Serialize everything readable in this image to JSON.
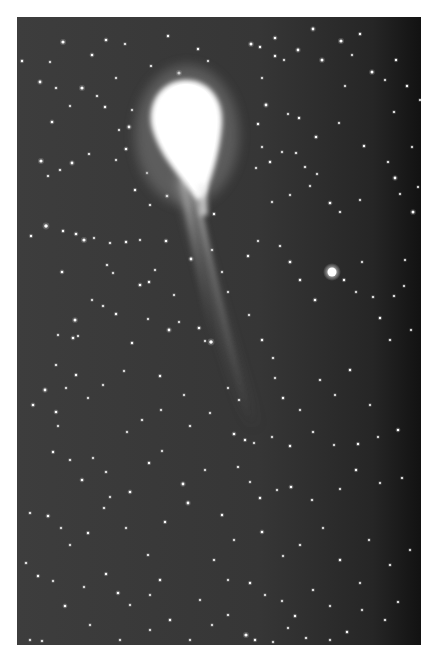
{
  "image": {
    "subject": "Comet with long ion tail against a star field",
    "frame": {
      "x": 17,
      "y": 17,
      "width": 404,
      "height": 628
    },
    "colors": {
      "margin": "#ffffff",
      "sky": "#3c3c3c",
      "sky_dark_edge": "#141414",
      "coma": "#ffffff",
      "tail": "#bdbdbd",
      "star": "#ffffff"
    }
  },
  "comet": {
    "head": {
      "cx": 186,
      "cy": 130,
      "rx": 36,
      "ry": 50
    },
    "nucleus_tip": {
      "x": 205,
      "y": 195
    },
    "tail_end": {
      "x": 258,
      "y": 425
    }
  },
  "bright_star": {
    "x": 332,
    "y": 272,
    "r": 4.5
  },
  "stars": [
    [
      63,
      42,
      1.6
    ],
    [
      106,
      40,
      1.3
    ],
    [
      125,
      44,
      1.1
    ],
    [
      168,
      36,
      1.2
    ],
    [
      198,
      49,
      1.2
    ],
    [
      251,
      44,
      1.5
    ],
    [
      275,
      38,
      1.3
    ],
    [
      298,
      50,
      1.4
    ],
    [
      322,
      60,
      1.5
    ],
    [
      360,
      34,
      1.2
    ],
    [
      372,
      72,
      1.5
    ],
    [
      396,
      60,
      1.2
    ],
    [
      50,
      62,
      1.0
    ],
    [
      92,
      55,
      1.3
    ],
    [
      151,
      66,
      1.1
    ],
    [
      179,
      73,
      1.6
    ],
    [
      208,
      61,
      1.0
    ],
    [
      260,
      47,
      1.2
    ],
    [
      275,
      56,
      1.2
    ],
    [
      284,
      60,
      1.0
    ],
    [
      313,
      29,
      1.4
    ],
    [
      341,
      41,
      1.6
    ],
    [
      352,
      55,
      1.0
    ],
    [
      22,
      61,
      1.2
    ],
    [
      40,
      82,
      1.4
    ],
    [
      82,
      88,
      1.6
    ],
    [
      105,
      107,
      1.2
    ],
    [
      116,
      78,
      1.0
    ],
    [
      132,
      110,
      1.0
    ],
    [
      52,
      122,
      1.3
    ],
    [
      56,
      88,
      1.1
    ],
    [
      70,
      106,
      1.0
    ],
    [
      97,
      96,
      1.1
    ],
    [
      119,
      130,
      1.0
    ],
    [
      129,
      127,
      1.4
    ],
    [
      262,
      78,
      1.0
    ],
    [
      266,
      105,
      1.4
    ],
    [
      258,
      124,
      1.2
    ],
    [
      288,
      114,
      1.0
    ],
    [
      299,
      118,
      1.2
    ],
    [
      345,
      86,
      1.0
    ],
    [
      385,
      80,
      1.0
    ],
    [
      407,
      86,
      1.2
    ],
    [
      420,
      100,
      1.0
    ],
    [
      394,
      112,
      1.1
    ],
    [
      316,
      137,
      1.3
    ],
    [
      282,
      152,
      1.0
    ],
    [
      41,
      161,
      1.6
    ],
    [
      72,
      163,
      1.4
    ],
    [
      89,
      154,
      1.1
    ],
    [
      48,
      176,
      1.1
    ],
    [
      116,
      160,
      1.0
    ],
    [
      126,
      149,
      1.3
    ],
    [
      147,
      173,
      1.0
    ],
    [
      60,
      170,
      1.1
    ],
    [
      135,
      190,
      1.2
    ],
    [
      167,
      196,
      1.3
    ],
    [
      150,
      205,
      1.1
    ],
    [
      214,
      214,
      1.2
    ],
    [
      256,
      168,
      1.0
    ],
    [
      262,
      147,
      1.0
    ],
    [
      296,
      153,
      1.1
    ],
    [
      339,
      123,
      1.0
    ],
    [
      364,
      146,
      1.2
    ],
    [
      388,
      162,
      1.1
    ],
    [
      395,
      178,
      1.4
    ],
    [
      412,
      147,
      1.0
    ],
    [
      418,
      187,
      1.0
    ],
    [
      413,
      212,
      1.5
    ],
    [
      270,
      162,
      1.2
    ],
    [
      305,
      167,
      1.1
    ],
    [
      317,
      174,
      1.0
    ],
    [
      310,
      186,
      1.0
    ],
    [
      290,
      195,
      1.0
    ],
    [
      272,
      202,
      1.0
    ],
    [
      330,
      203,
      1.3
    ],
    [
      340,
      212,
      1.1
    ],
    [
      360,
      200,
      1.0
    ],
    [
      400,
      194,
      1.0
    ],
    [
      46,
      226,
      1.8
    ],
    [
      63,
      231,
      1.2
    ],
    [
      76,
      234,
      1.3
    ],
    [
      84,
      240,
      1.6
    ],
    [
      94,
      238,
      1.0
    ],
    [
      31,
      236,
      1.2
    ],
    [
      110,
      243,
      1.1
    ],
    [
      126,
      242,
      1.2
    ],
    [
      140,
      240,
      1.0
    ],
    [
      166,
      241,
      1.3
    ],
    [
      62,
      272,
      1.3
    ],
    [
      107,
      265,
      1.1
    ],
    [
      113,
      273,
      1.0
    ],
    [
      140,
      285,
      1.3
    ],
    [
      149,
      282,
      1.2
    ],
    [
      155,
      270,
      1.0
    ],
    [
      174,
      295,
      1.0
    ],
    [
      92,
      300,
      1.0
    ],
    [
      103,
      306,
      1.1
    ],
    [
      116,
      314,
      1.2
    ],
    [
      73,
      338,
      1.3
    ],
    [
      75,
      320,
      1.5
    ],
    [
      78,
      336,
      1.0
    ],
    [
      58,
      335,
      1.0
    ],
    [
      132,
      343,
      1.2
    ],
    [
      148,
      319,
      1.0
    ],
    [
      169,
      330,
      1.4
    ],
    [
      179,
      322,
      1.0
    ],
    [
      199,
      328,
      1.3
    ],
    [
      205,
      341,
      1.0
    ],
    [
      191,
      259,
      1.4
    ],
    [
      212,
      250,
      1.1
    ],
    [
      222,
      272,
      1.0
    ],
    [
      228,
      292,
      1.0
    ],
    [
      248,
      256,
      1.2
    ],
    [
      258,
      241,
      1.0
    ],
    [
      280,
      246,
      1.1
    ],
    [
      290,
      262,
      1.3
    ],
    [
      300,
      280,
      1.2
    ],
    [
      315,
      300,
      1.3
    ],
    [
      344,
      280,
      1.2
    ],
    [
      356,
      292,
      1.0
    ],
    [
      362,
      262,
      1.0
    ],
    [
      373,
      297,
      1.1
    ],
    [
      394,
      296,
      1.1
    ],
    [
      404,
      286,
      1.0
    ],
    [
      405,
      260,
      1.0
    ],
    [
      380,
      318,
      1.2
    ],
    [
      390,
      340,
      1.1
    ],
    [
      411,
      330,
      1.0
    ],
    [
      56,
      365,
      1.1
    ],
    [
      45,
      390,
      1.4
    ],
    [
      66,
      388,
      1.0
    ],
    [
      76,
      375,
      1.2
    ],
    [
      56,
      412,
      1.3
    ],
    [
      88,
      398,
      1.0
    ],
    [
      103,
      385,
      1.0
    ],
    [
      124,
      371,
      1.0
    ],
    [
      160,
      376,
      1.2
    ],
    [
      211,
      342,
      1.8
    ],
    [
      33,
      405,
      1.3
    ],
    [
      58,
      426,
      1.0
    ],
    [
      127,
      432,
      1.0
    ],
    [
      142,
      420,
      1.1
    ],
    [
      161,
      410,
      1.0
    ],
    [
      184,
      395,
      1.0
    ],
    [
      190,
      426,
      1.1
    ],
    [
      210,
      413,
      1.0
    ],
    [
      228,
      388,
      1.0
    ],
    [
      239,
      400,
      1.1
    ],
    [
      249,
      315,
      1.0
    ],
    [
      262,
      340,
      1.2
    ],
    [
      273,
      358,
      1.1
    ],
    [
      275,
      378,
      1.0
    ],
    [
      283,
      398,
      1.2
    ],
    [
      300,
      410,
      1.0
    ],
    [
      320,
      380,
      1.1
    ],
    [
      335,
      395,
      1.0
    ],
    [
      350,
      370,
      1.2
    ],
    [
      370,
      405,
      1.0
    ],
    [
      53,
      452,
      1.2
    ],
    [
      70,
      460,
      1.1
    ],
    [
      82,
      480,
      1.3
    ],
    [
      93,
      458,
      1.0
    ],
    [
      106,
      472,
      1.1
    ],
    [
      110,
      497,
      1.0
    ],
    [
      130,
      492,
      1.3
    ],
    [
      149,
      463,
      1.2
    ],
    [
      162,
      451,
      1.0
    ],
    [
      183,
      484,
      1.4
    ],
    [
      30,
      513,
      1.1
    ],
    [
      48,
      516,
      1.3
    ],
    [
      61,
      528,
      1.0
    ],
    [
      70,
      545,
      1.0
    ],
    [
      88,
      533,
      1.2
    ],
    [
      104,
      508,
      1.1
    ],
    [
      126,
      528,
      1.0
    ],
    [
      148,
      555,
      1.1
    ],
    [
      165,
      522,
      1.2
    ],
    [
      188,
      503,
      1.4
    ],
    [
      26,
      563,
      1.1
    ],
    [
      38,
      576,
      1.2
    ],
    [
      53,
      581,
      1.0
    ],
    [
      65,
      606,
      1.3
    ],
    [
      84,
      587,
      1.0
    ],
    [
      106,
      574,
      1.2
    ],
    [
      118,
      593,
      1.3
    ],
    [
      130,
      605,
      1.0
    ],
    [
      150,
      595,
      1.0
    ],
    [
      160,
      580,
      1.2
    ],
    [
      234,
      434,
      1.3
    ],
    [
      245,
      440,
      1.2
    ],
    [
      254,
      443,
      1.0
    ],
    [
      272,
      437,
      1.0
    ],
    [
      290,
      446,
      1.2
    ],
    [
      313,
      432,
      1.1
    ],
    [
      334,
      445,
      1.0
    ],
    [
      358,
      444,
      1.2
    ],
    [
      378,
      437,
      1.0
    ],
    [
      398,
      430,
      1.3
    ],
    [
      238,
      467,
      1.1
    ],
    [
      250,
      482,
      1.0
    ],
    [
      260,
      498,
      1.2
    ],
    [
      277,
      490,
      1.0
    ],
    [
      291,
      487,
      1.3
    ],
    [
      312,
      500,
      1.1
    ],
    [
      340,
      489,
      1.0
    ],
    [
      356,
      470,
      1.2
    ],
    [
      380,
      483,
      1.0
    ],
    [
      402,
      478,
      1.1
    ],
    [
      222,
      515,
      1.2
    ],
    [
      234,
      540,
      1.0
    ],
    [
      262,
      532,
      1.3
    ],
    [
      283,
      556,
      1.0
    ],
    [
      300,
      545,
      1.1
    ],
    [
      323,
      528,
      1.0
    ],
    [
      340,
      560,
      1.2
    ],
    [
      369,
      540,
      1.0
    ],
    [
      390,
      565,
      1.1
    ],
    [
      410,
      550,
      1.0
    ],
    [
      228,
      580,
      1.0
    ],
    [
      250,
      583,
      1.2
    ],
    [
      265,
      595,
      1.0
    ],
    [
      282,
      601,
      1.0
    ],
    [
      295,
      616,
      1.2
    ],
    [
      313,
      590,
      1.1
    ],
    [
      330,
      606,
      1.0
    ],
    [
      347,
      632,
      1.2
    ],
    [
      360,
      583,
      1.0
    ],
    [
      385,
      620,
      1.1
    ],
    [
      212,
      625,
      1.0
    ],
    [
      228,
      615,
      1.1
    ],
    [
      246,
      635,
      1.6
    ],
    [
      255,
      640,
      1.2
    ],
    [
      273,
      642,
      1.0
    ],
    [
      288,
      628,
      1.0
    ],
    [
      306,
      638,
      1.1
    ],
    [
      330,
      640,
      1.0
    ],
    [
      362,
      610,
      1.0
    ],
    [
      398,
      602,
      1.1
    ],
    [
      150,
      630,
      1.0
    ],
    [
      170,
      620,
      1.2
    ],
    [
      190,
      640,
      1.0
    ],
    [
      30,
      640,
      1.0
    ],
    [
      42,
      641,
      1.1
    ],
    [
      90,
      625,
      1.0
    ],
    [
      120,
      640,
      1.0
    ],
    [
      200,
      600,
      1.0
    ],
    [
      214,
      560,
      1.1
    ],
    [
      205,
      470,
      1.0
    ]
  ],
  "caption": "Comet photograph"
}
